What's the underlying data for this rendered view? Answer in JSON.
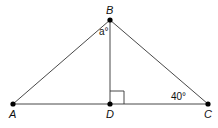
{
  "diagram": {
    "type": "triangle",
    "points": {
      "A": {
        "label": "A",
        "x": 13,
        "y": 104
      },
      "B": {
        "label": "B",
        "x": 110,
        "y": 20
      },
      "C": {
        "label": "C",
        "x": 208,
        "y": 104
      },
      "D": {
        "label": "D",
        "x": 110,
        "y": 104
      }
    },
    "angle_labels": {
      "ABD": "a°",
      "BCD": "40°"
    },
    "right_angle_at": "D",
    "colors": {
      "line": "#333333",
      "point": "#000000"
    }
  }
}
